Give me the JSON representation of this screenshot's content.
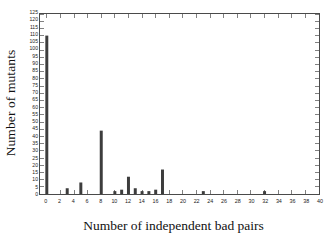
{
  "chart_data": {
    "type": "bar",
    "title": "",
    "subtitle": "",
    "xlabel": "Number of independent bad pairs",
    "ylabel": "Number of mutants",
    "xlim": [
      -1,
      40
    ],
    "ylim": [
      0,
      125
    ],
    "xtick_step": 2,
    "ytick_step": 5,
    "grid": false,
    "legend": null,
    "bar_color": "#3d3d3d",
    "frame_color": "#4a4a4a",
    "background_color": "#ffffff",
    "xticks": [
      0,
      2,
      4,
      6,
      8,
      10,
      12,
      14,
      16,
      18,
      20,
      22,
      24,
      26,
      28,
      30,
      32,
      34,
      36,
      38,
      40
    ],
    "yticks": [
      0,
      5,
      10,
      15,
      20,
      25,
      30,
      35,
      40,
      45,
      50,
      55,
      60,
      65,
      70,
      75,
      80,
      85,
      90,
      95,
      100,
      105,
      110,
      115,
      120,
      125
    ],
    "categories": [
      0,
      1,
      2,
      3,
      4,
      5,
      6,
      7,
      8,
      9,
      10,
      11,
      12,
      13,
      14,
      15,
      16,
      17,
      18,
      19,
      20,
      21,
      22,
      23,
      24,
      25,
      26,
      27,
      28,
      29,
      30,
      31,
      32,
      33,
      34,
      35,
      36,
      37,
      38,
      39,
      40
    ],
    "values": [
      110,
      0,
      0,
      4,
      0,
      8,
      0,
      0,
      44,
      0,
      2,
      3,
      12,
      4,
      2,
      2,
      3,
      17,
      0,
      0,
      0,
      0,
      0,
      2,
      0,
      0,
      0,
      0,
      0,
      0,
      0,
      0,
      2,
      0,
      0,
      0,
      0,
      0,
      0,
      0,
      0
    ],
    "nonzero_points": [
      {
        "x": 0,
        "y": 110
      },
      {
        "x": 3,
        "y": 4
      },
      {
        "x": 5,
        "y": 8
      },
      {
        "x": 8,
        "y": 44
      },
      {
        "x": 10,
        "y": 2
      },
      {
        "x": 11,
        "y": 3
      },
      {
        "x": 12,
        "y": 12
      },
      {
        "x": 13,
        "y": 4
      },
      {
        "x": 14,
        "y": 2
      },
      {
        "x": 15,
        "y": 2
      },
      {
        "x": 16,
        "y": 3
      },
      {
        "x": 17,
        "y": 17
      },
      {
        "x": 23,
        "y": 2
      },
      {
        "x": 32,
        "y": 2
      }
    ]
  }
}
